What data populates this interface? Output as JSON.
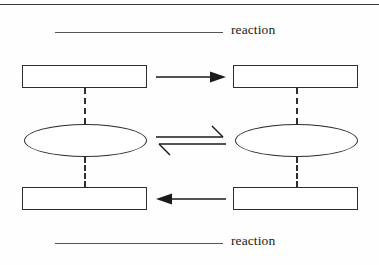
{
  "page": {
    "top_rule": "horizontal-rule"
  },
  "labels": {
    "top": {
      "blank": "",
      "word": "reaction"
    },
    "bottom": {
      "blank": "",
      "word": "reaction"
    }
  },
  "diagram": {
    "type": "cycle-diagram",
    "left_column": {
      "top_box": "",
      "ellipse": "",
      "bottom_box": ""
    },
    "right_column": {
      "top_box": "",
      "ellipse": "",
      "bottom_box": ""
    },
    "connectors": {
      "top_arrow": "arrow-right",
      "middle_arrow": "equilibrium-arrow",
      "bottom_arrow": "arrow-left"
    }
  },
  "colors": {
    "ink": "#1a1a1a",
    "line": "#2e2e2e",
    "rule": "#555555",
    "background": "#fefefe"
  }
}
